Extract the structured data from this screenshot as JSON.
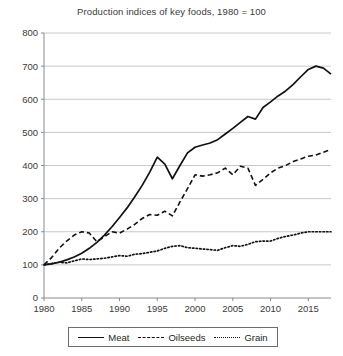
{
  "chart_data": {
    "type": "line",
    "title": "Production indices of key foods, 1980 = 100",
    "xlabel": "",
    "ylabel": "",
    "xlim": [
      1980,
      2018
    ],
    "ylim": [
      0,
      800
    ],
    "grid": true,
    "legend_position": "bottom",
    "xticks": [
      1980,
      1985,
      1990,
      1995,
      2000,
      2005,
      2010,
      2015
    ],
    "yticks": [
      0,
      100,
      200,
      300,
      400,
      500,
      600,
      700,
      800
    ],
    "x": [
      1980,
      1981,
      1982,
      1983,
      1984,
      1985,
      1986,
      1987,
      1988,
      1989,
      1990,
      1991,
      1992,
      1993,
      1994,
      1995,
      1996,
      1997,
      1998,
      1999,
      2000,
      2001,
      2002,
      2003,
      2004,
      2005,
      2006,
      2007,
      2008,
      2009,
      2010,
      2011,
      2012,
      2013,
      2014,
      2015,
      2016,
      2017,
      2018
    ],
    "series": [
      {
        "name": "Meat",
        "style": "solid",
        "color": "#111111",
        "values": [
          100,
          103,
          108,
          115,
          124,
          135,
          150,
          168,
          190,
          215,
          243,
          272,
          305,
          340,
          380,
          425,
          404,
          360,
          400,
          438,
          455,
          462,
          468,
          478,
          495,
          512,
          530,
          548,
          540,
          575,
          592,
          610,
          625,
          645,
          668,
          690,
          700,
          694,
          676
        ]
      },
      {
        "name": "Oilseeds",
        "style": "dashed",
        "color": "#111111",
        "values": [
          100,
          122,
          150,
          172,
          190,
          200,
          196,
          170,
          185,
          200,
          196,
          208,
          222,
          240,
          252,
          250,
          262,
          248,
          290,
          330,
          372,
          368,
          372,
          378,
          392,
          372,
          398,
          392,
          340,
          358,
          378,
          392,
          400,
          412,
          420,
          428,
          432,
          440,
          448
        ]
      },
      {
        "name": "Grain",
        "style": "dotted",
        "color": "#111111",
        "values": [
          100,
          104,
          108,
          106,
          112,
          118,
          116,
          118,
          120,
          124,
          128,
          126,
          132,
          134,
          138,
          142,
          150,
          156,
          158,
          152,
          150,
          148,
          146,
          144,
          152,
          158,
          156,
          162,
          170,
          172,
          172,
          180,
          186,
          190,
          196,
          200,
          200,
          200,
          200
        ]
      }
    ]
  },
  "legend": {
    "entries": [
      {
        "label": "Meat",
        "style": "solid"
      },
      {
        "label": "Oilseeds",
        "style": "dashed"
      },
      {
        "label": "Grain",
        "style": "dotted"
      }
    ]
  }
}
